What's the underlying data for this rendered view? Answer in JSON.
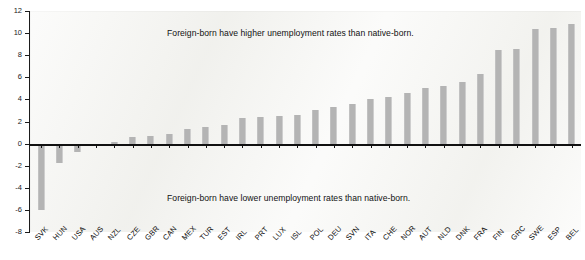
{
  "chart_data": {
    "type": "bar",
    "title": "",
    "subtitle": "",
    "xlabel": "",
    "ylabel": "",
    "ylim": [
      -8,
      12
    ],
    "ytick_step": 2,
    "yticks": [
      12,
      10,
      8,
      6,
      4,
      2,
      0,
      -2,
      -4,
      -6,
      -8
    ],
    "ytick_labels": [
      "12",
      "10",
      "8",
      "6",
      "4",
      "2",
      "0",
      "-2",
      "-4",
      "-6",
      "-8"
    ],
    "grid": false,
    "legend": "none",
    "bar_color": "#b4b4b4",
    "plot_background": "#f4f4f1",
    "axis_color": "#111111",
    "categories": [
      "SVK",
      "HUN",
      "USA",
      "AUS",
      "NZL",
      "CZE",
      "GBR",
      "CAN",
      "MEX",
      "TUR",
      "EST",
      "IRL",
      "PRT",
      "LUX",
      "ISL",
      "POL",
      "DEU",
      "SVN",
      "ITA",
      "CHE",
      "NOR",
      "AUT",
      "NLD",
      "DNK",
      "FRA",
      "FIN",
      "GRC",
      "SWE",
      "ESP",
      "BEL"
    ],
    "values": [
      -6.0,
      -1.8,
      -0.8,
      -0.1,
      0.1,
      0.6,
      0.7,
      0.9,
      1.3,
      1.5,
      1.7,
      2.3,
      2.4,
      2.5,
      2.6,
      3.0,
      3.3,
      3.6,
      4.0,
      4.2,
      4.6,
      5.0,
      5.2,
      5.6,
      6.3,
      8.5,
      8.6,
      10.4,
      10.5,
      10.8
    ],
    "annotations": [
      {
        "name": "higher-rates-note",
        "text": "Foreign-born have higher unemployment rates than native-born."
      },
      {
        "name": "lower-rates-note",
        "text": "Foreign-born have lower unemployment rates than native-born."
      }
    ]
  }
}
